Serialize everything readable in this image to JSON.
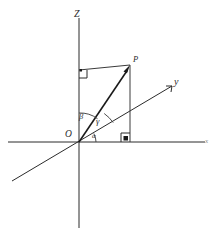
{
  "figure": {
    "kind": "3d-cartesian-axes-direction-angles",
    "background_color": "#ffffff",
    "line_color": "#2b2b2b",
    "width": 216,
    "height": 236
  },
  "axes": {
    "z": {
      "label": "Z",
      "label_x": 78,
      "label_y": 13,
      "x1": 79,
      "y1": 18,
      "x2": 79,
      "y2": 228
    },
    "x": {
      "label": "x",
      "label_x": 207,
      "label_y": 141,
      "x1": 8,
      "y1": 142,
      "x2": 205,
      "y2": 142
    },
    "y": {
      "label": "y",
      "label_x": 175,
      "label_y": 82,
      "x1": 12,
      "y1": 181,
      "x2": 172,
      "y2": 86
    }
  },
  "origin": {
    "label": "O",
    "label_x": 69,
    "label_y": 136,
    "x": 79,
    "y": 142
  },
  "point_p": {
    "label": "P",
    "label_x": 136,
    "label_y": 60,
    "x": 130,
    "y": 66
  },
  "vector": {
    "name": "OP",
    "from_x": 79,
    "from_y": 142,
    "to_x": 129,
    "to_y": 68
  },
  "construction_lines": [
    {
      "name": "p-to-z-axis",
      "x1": 79,
      "y1": 70,
      "x2": 130,
      "y2": 65
    },
    {
      "name": "p-to-x-axis-vertical",
      "x1": 130,
      "y1": 65,
      "x2": 130,
      "y2": 142
    }
  ],
  "right_angles": [
    {
      "name": "right-angle-at-z-axis",
      "x": 79,
      "y": 70,
      "size": 8,
      "dir_x": 1,
      "dir_y": 1
    },
    {
      "name": "right-angle-at-x-axis",
      "x": 130,
      "y": 142,
      "size": 9,
      "dir_x": -1,
      "dir_y": -1
    }
  ],
  "angles": [
    {
      "id": "beta",
      "label": "β",
      "label_x": 82,
      "label_y": 116,
      "description": "angle between Z axis and vector OP",
      "radius": 29
    },
    {
      "id": "gamma",
      "label": "γ",
      "label_x": 99,
      "label_y": 121,
      "description": "angle between vector OP and y axis",
      "radius": 38
    },
    {
      "id": "alpha",
      "label": "α",
      "label_x": 95,
      "label_y": 136,
      "description": "angle between y axis and x axis direction at origin",
      "radius": 17
    }
  ]
}
